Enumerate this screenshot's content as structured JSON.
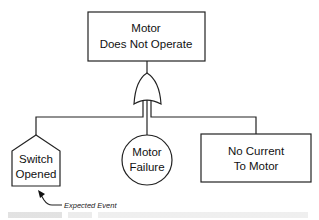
{
  "diagram": {
    "type": "fault-tree",
    "top_event": {
      "line1": "Motor",
      "line2": "Does Not Operate"
    },
    "gate": {
      "type": "OR"
    },
    "children": [
      {
        "kind": "house-event",
        "line1": "Switch",
        "line2": "Opened"
      },
      {
        "kind": "basic-event",
        "line1": "Motor",
        "line2": "Failure"
      },
      {
        "kind": "intermediate-event",
        "line1": "No Current",
        "line2": "To Motor"
      }
    ],
    "annotation": {
      "text": "Expected Event",
      "points_to": "Switch Opened"
    }
  }
}
